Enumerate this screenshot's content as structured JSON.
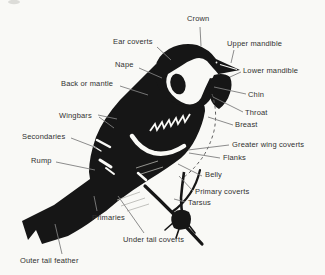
{
  "figure": {
    "type": "labeled-anatomy-diagram",
    "background_color": "#f9f9f6",
    "ink_color": "#161616",
    "label_text_color": "#313131",
    "leader_line_color": "#7f7f7f"
  },
  "labels": [
    {
      "id": "crown",
      "text": "Crown",
      "x": 187,
      "y": 15,
      "leaders": [
        [
          200,
          27,
          201,
          46
        ]
      ]
    },
    {
      "id": "ear-coverts",
      "text": "Ear coverts",
      "x": 113,
      "y": 38,
      "leaders": [
        [
          157,
          47,
          171,
          60
        ]
      ]
    },
    {
      "id": "upper-mandible",
      "text": "Upper mandible",
      "x": 227,
      "y": 40,
      "leaders": [
        [
          234,
          50,
          231,
          63
        ]
      ]
    },
    {
      "id": "nape",
      "text": "Nape",
      "x": 115,
      "y": 61,
      "leaders": [
        [
          139,
          68,
          162,
          78
        ]
      ]
    },
    {
      "id": "lower-mandible",
      "text": "Lower mandible",
      "x": 243,
      "y": 67,
      "leaders": [
        [
          241,
          72,
          230,
          77
        ]
      ]
    },
    {
      "id": "back-or-mantle",
      "text": "Back or mantle",
      "x": 61,
      "y": 80,
      "leaders": [
        [
          120,
          86,
          148,
          95
        ]
      ]
    },
    {
      "id": "chin",
      "text": "Chin",
      "x": 248,
      "y": 91,
      "leaders": [
        [
          246,
          94,
          214,
          87
        ]
      ]
    },
    {
      "id": "throat",
      "text": "Throat",
      "x": 245,
      "y": 109,
      "leaders": [
        [
          243,
          112,
          213,
          97
        ]
      ]
    },
    {
      "id": "wingbars",
      "text": "Wingbars",
      "x": 59,
      "y": 112,
      "leaders": [
        [
          98,
          115,
          117,
          119
        ],
        [
          99,
          117,
          114,
          128
        ]
      ]
    },
    {
      "id": "breast",
      "text": "Breast",
      "x": 235,
      "y": 121,
      "leaders": [
        [
          233,
          125,
          208,
          117
        ]
      ]
    },
    {
      "id": "secondaries",
      "text": "Secondaries",
      "x": 22,
      "y": 133,
      "leaders": [
        [
          71,
          138,
          97,
          148
        ]
      ]
    },
    {
      "id": "greater-wing-coverts",
      "text": "Greater wing coverts",
      "x": 232,
      "y": 141,
      "leaders": [
        [
          229,
          145,
          188,
          150
        ]
      ]
    },
    {
      "id": "flanks",
      "text": "Flanks",
      "x": 223,
      "y": 154,
      "leaders": [
        [
          220,
          158,
          189,
          153
        ]
      ]
    },
    {
      "id": "rump",
      "text": "Rump",
      "x": 31,
      "y": 157,
      "leaders": [
        [
          56,
          162,
          95,
          170
        ]
      ]
    },
    {
      "id": "belly",
      "text": "Belly",
      "x": 205,
      "y": 171,
      "leaders": [
        [
          202,
          176,
          178,
          164
        ]
      ]
    },
    {
      "id": "primary-coverts",
      "text": "Primary coverts",
      "x": 195,
      "y": 188,
      "leaders": [
        [
          193,
          191,
          179,
          176
        ]
      ]
    },
    {
      "id": "tarsus",
      "text": "Tarsus",
      "x": 188,
      "y": 199,
      "leaders": [
        [
          185,
          202,
          174,
          199
        ]
      ]
    },
    {
      "id": "primaries",
      "text": "Primaries",
      "x": 92,
      "y": 214,
      "leaders": [
        [
          97,
          211,
          94,
          196
        ]
      ]
    },
    {
      "id": "under-tail-coverts",
      "text": "Under tail coverts",
      "x": 123,
      "y": 236,
      "leaders": [
        [
          144,
          233,
          118,
          196
        ]
      ]
    },
    {
      "id": "outer-tail-feather",
      "text": "Outer tail feather",
      "x": 20,
      "y": 257,
      "leaders": [
        [
          62,
          254,
          55,
          224
        ]
      ]
    }
  ]
}
